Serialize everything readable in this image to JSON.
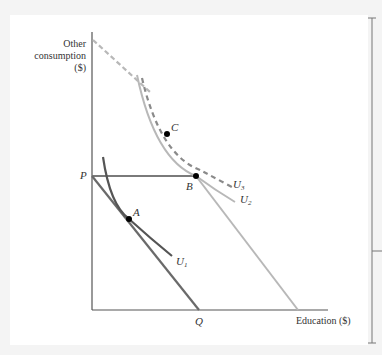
{
  "diagram": {
    "type": "indifference_curve_budget_constraint",
    "y_axis_label_lines": [
      "Other",
      "consumption",
      "($)"
    ],
    "x_axis_label": "Education ($)",
    "points": {
      "P": "P",
      "Q": "Q",
      "A": "A",
      "B": "B",
      "C": "C"
    },
    "curves": {
      "U1": {
        "letter": "U",
        "sub": "1"
      },
      "U2": {
        "letter": "U",
        "sub": "2"
      },
      "U3": {
        "letter": "U",
        "sub": "3"
      }
    },
    "colors": {
      "axis": "#555555",
      "budget_original": "#6a6a6a",
      "budget_subsidized": "#b8b8b8",
      "budget_dashed": "#b8b8b8",
      "u1": "#555555",
      "u2": "#b8b8b8",
      "u3_dashed": "#8a8a8a",
      "point": "#000000"
    },
    "right_edge_label": "($)"
  }
}
